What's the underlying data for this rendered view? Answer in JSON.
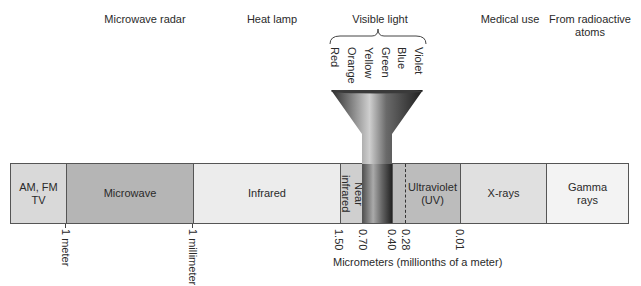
{
  "top_labels": {
    "microwave_radar": "Microwave radar",
    "heat_lamp": "Heat lamp",
    "visible_light": "Visible light",
    "medical_use": "Medical use",
    "radioactive": "From radioactive atoms"
  },
  "visible_colors": [
    "Red",
    "Orange",
    "Yellow",
    "Green",
    "Blue",
    "Violet"
  ],
  "segments": [
    {
      "label": "AM, FM TV",
      "color": "#d9d9d9"
    },
    {
      "label": "Microwave",
      "color": "#b5b5b5"
    },
    {
      "label": "Infrared",
      "color": "#ececec"
    },
    {
      "label": "Near infrared",
      "color": "#cfcfcf"
    },
    {
      "label": "Ultraviolet (UV)",
      "color": "#bcbcbc"
    },
    {
      "label": "X-rays",
      "color": "#e0e0e0"
    },
    {
      "label": "Gamma rays",
      "color": "#f3f3f3"
    }
  ],
  "ticks": {
    "one_meter": "1 meter",
    "one_millimeter": "1 millimeter",
    "v150": "1.50",
    "v070": "0.70",
    "v040": "0.40",
    "v028": "0.28",
    "v001": "0.01"
  },
  "axis_title": "Micrometers (millionths of a meter)"
}
